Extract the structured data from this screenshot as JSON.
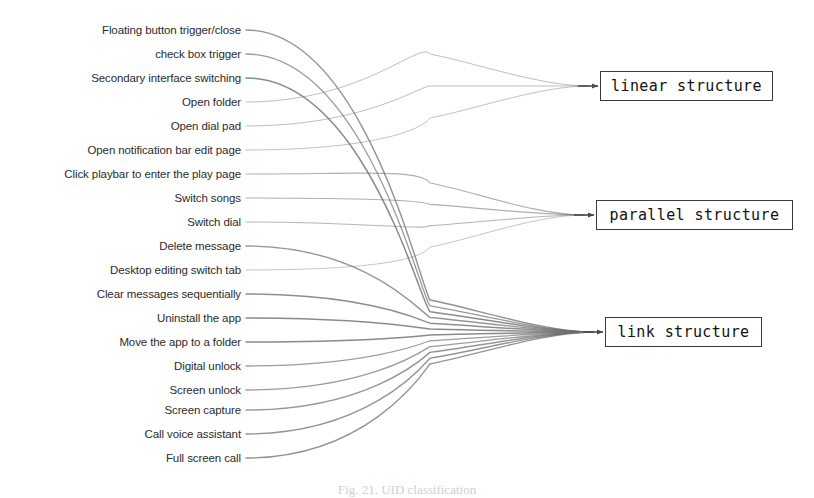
{
  "figure": {
    "caption": "Fig. 21. UID classification",
    "type": "sankey-flow-diagram",
    "width": 814,
    "height": 496,
    "background": "#ffffff",
    "link_color": "#6e6e6e",
    "box_border_color": "#3a3a3a",
    "label_color": "#2b2b2b"
  },
  "sources": [
    {
      "id": "floating-button-trigger-close",
      "label": "Floating button trigger/close",
      "y": 30,
      "target": "link",
      "weight": 1.4,
      "opacity": 0.75
    },
    {
      "id": "check-box-trigger",
      "label": "check box trigger",
      "y": 54,
      "target": "link",
      "weight": 1.3,
      "opacity": 0.7
    },
    {
      "id": "secondary-interface-switching",
      "label": "Secondary interface switching",
      "y": 78,
      "target": "link",
      "weight": 1.5,
      "opacity": 0.8
    },
    {
      "id": "open-folder",
      "label": "Open folder",
      "y": 102,
      "target": "linear",
      "weight": 1.0,
      "opacity": 0.45
    },
    {
      "id": "open-dial-pad",
      "label": "Open dial pad",
      "y": 126,
      "target": "linear",
      "weight": 1.0,
      "opacity": 0.45
    },
    {
      "id": "open-notification-bar-edit-page",
      "label": "Open notification bar edit page",
      "y": 150,
      "target": "linear",
      "weight": 1.0,
      "opacity": 0.42
    },
    {
      "id": "click-playbar-to-enter-play-page",
      "label": "Click playbar to enter the play page",
      "y": 174,
      "target": "parallel",
      "weight": 1.2,
      "opacity": 0.55
    },
    {
      "id": "switch-songs",
      "label": "Switch songs",
      "y": 198,
      "target": "parallel",
      "weight": 1.2,
      "opacity": 0.55
    },
    {
      "id": "switch-dial",
      "label": "Switch dial",
      "y": 222,
      "target": "parallel",
      "weight": 1.1,
      "opacity": 0.5
    },
    {
      "id": "delete-message",
      "label": "Delete message",
      "y": 246,
      "target": "link",
      "weight": 1.4,
      "opacity": 0.72
    },
    {
      "id": "desktop-editing-switch-tab",
      "label": "Desktop editing switch tab",
      "y": 270,
      "target": "parallel",
      "weight": 1.0,
      "opacity": 0.4
    },
    {
      "id": "clear-messages-sequentially",
      "label": "Clear messages sequentially",
      "y": 294,
      "target": "link",
      "weight": 1.5,
      "opacity": 0.78
    },
    {
      "id": "uninstall-the-app",
      "label": "Uninstall the app",
      "y": 318,
      "target": "link",
      "weight": 1.5,
      "opacity": 0.8
    },
    {
      "id": "move-the-app-to-a-folder",
      "label": "Move the app to a folder",
      "y": 342,
      "target": "link",
      "weight": 1.5,
      "opacity": 0.8
    },
    {
      "id": "digital-unlock",
      "label": "Digital unlock",
      "y": 366,
      "target": "link",
      "weight": 1.3,
      "opacity": 0.68
    },
    {
      "id": "screen-unlock",
      "label": "Screen unlock",
      "y": 390,
      "target": "link",
      "weight": 1.3,
      "opacity": 0.68
    },
    {
      "id": "screen-capture",
      "label": "Screen capture",
      "y": 410,
      "target": "link",
      "weight": 1.4,
      "opacity": 0.72
    },
    {
      "id": "call-voice-assistant",
      "label": "Call voice assistant",
      "y": 434,
      "target": "link",
      "weight": 1.4,
      "opacity": 0.74
    },
    {
      "id": "full-screen-call",
      "label": "Full screen call",
      "y": 458,
      "target": "link",
      "weight": 1.4,
      "opacity": 0.74
    }
  ],
  "targets": [
    {
      "id": "linear",
      "label": "linear structure",
      "x": 600,
      "y": 71,
      "w": 173,
      "h": 30
    },
    {
      "id": "parallel",
      "label": "parallel structure",
      "x": 596,
      "y": 200,
      "w": 197,
      "h": 30
    },
    {
      "id": "link",
      "label": "link structure",
      "x": 605,
      "y": 317,
      "w": 157,
      "h": 30
    }
  ],
  "geometry": {
    "source_x": 246,
    "bundle_x": 430,
    "arrow_gap": 8
  }
}
